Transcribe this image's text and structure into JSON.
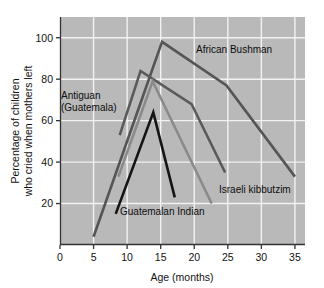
{
  "chart_data": {
    "type": "line",
    "title": "",
    "xlabel": "Age (months)",
    "ylabel": "Percentage of children who cried when mothers left",
    "ylabel_line1": "Percentage of children",
    "ylabel_line2": "who cried when mothers left",
    "xlim": [
      0,
      36.5
    ],
    "ylim": [
      0,
      110
    ],
    "xticks": [
      0,
      5,
      10,
      15,
      20,
      25,
      30,
      35
    ],
    "xticklabels": [
      "0",
      "5",
      "10",
      "15",
      "20",
      "25",
      "30",
      "35"
    ],
    "yticks": [
      20,
      40,
      60,
      80,
      100
    ],
    "yticklabels": [
      "20",
      "40",
      "60",
      "80",
      "100"
    ],
    "grid": true,
    "grid_color": "#f2f2f2",
    "plot_background": "#b9b9b9",
    "legend": "inline-annotations",
    "series": [
      {
        "name": "African Bushman",
        "color": "#555555",
        "x": [
          5,
          15.2,
          24.8,
          35
        ],
        "y": [
          4,
          98,
          77,
          33
        ]
      },
      {
        "name": "Antiguan (Guatemala)",
        "color": "#5a5a5a",
        "x": [
          8.9,
          12,
          19.6,
          24.6
        ],
        "y": [
          53,
          84,
          68,
          35
        ]
      },
      {
        "name": "Israeli kibbutzim",
        "color": "#8a8a8a",
        "x": [
          8.7,
          13.8,
          22.6
        ],
        "y": [
          33,
          79,
          20
        ]
      },
      {
        "name": "Guatemalan Indian",
        "color": "#151515",
        "x": [
          8.3,
          13.9,
          17.1
        ],
        "y": [
          15,
          64,
          23
        ]
      }
    ],
    "annotations": [
      {
        "name": "african-bushman-label",
        "text": "African Bushman",
        "x": 196,
        "y": 53
      },
      {
        "name": "antiguan-label-line1",
        "text": "Antiguan",
        "x": 61,
        "y": 99
      },
      {
        "name": "antiguan-label-line2",
        "text": "(Guatemala)",
        "x": 61,
        "y": 111
      },
      {
        "name": "israeli-kibbutzim-label",
        "text": "Israeli kibbutzim",
        "x": 219,
        "y": 193
      },
      {
        "name": "guatemalan-indian-label",
        "text": "Guatemalan Indian",
        "x": 120,
        "y": 215
      }
    ]
  }
}
